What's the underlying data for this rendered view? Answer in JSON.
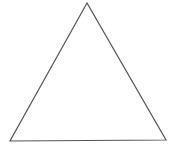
{
  "diagram": {
    "shape": "triangle",
    "stroke_color": "#555555",
    "fill_color": "none",
    "stroke_width": 1.2,
    "vertices": [
      {
        "name": "apex",
        "x": 87,
        "y": 3
      },
      {
        "name": "bottom-left",
        "x": 10,
        "y": 141
      },
      {
        "name": "bottom-right",
        "x": 166,
        "y": 140
      }
    ]
  }
}
